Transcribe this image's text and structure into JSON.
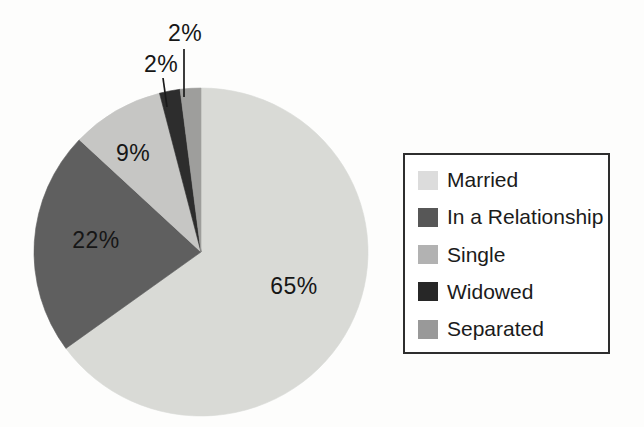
{
  "figure": {
    "background": "#fdfdfc"
  },
  "chart_data": {
    "type": "pie",
    "title": "",
    "legend_position": "right",
    "legend_border_color": "#2e2e2e",
    "legend_background": "#ffffff",
    "label_color": "#161616",
    "leader_line_color": "#1a1a1a",
    "categories": [
      "Married",
      "In a Relationship",
      "Single",
      "Widowed",
      "Separated"
    ],
    "values": [
      65,
      22,
      9,
      2,
      2
    ],
    "slices": [
      {
        "label": "Married",
        "value": 65,
        "pct_label": "65%",
        "slice_color": "#d9dad6",
        "swatch_color": "#dcdcdc",
        "label_x": 294,
        "label_y": 294,
        "leader": null
      },
      {
        "label": "In a Relationship",
        "value": 22,
        "pct_label": "22%",
        "slice_color": "#5f5f5f",
        "swatch_color": "#575757",
        "label_x": 96,
        "label_y": 248,
        "leader": null
      },
      {
        "label": "Single",
        "value": 9,
        "pct_label": "9%",
        "slice_color": "#c6c6c4",
        "swatch_color": "#b2b2b2",
        "label_x": 133,
        "label_y": 161,
        "leader": null
      },
      {
        "label": "Widowed",
        "value": 2,
        "pct_label": "2%",
        "slice_color": "#2d2d2d",
        "swatch_color": "#272727",
        "label_x": 161,
        "label_y": 72,
        "leader": {
          "x1": 163,
          "y1": 78,
          "x2": 167,
          "y2": 107
        }
      },
      {
        "label": "Separated",
        "value": 2,
        "pct_label": "2%",
        "slice_color": "#9e9e9c",
        "swatch_color": "#999999",
        "label_x": 185,
        "label_y": 41,
        "leader": {
          "x1": 184,
          "y1": 49,
          "x2": 184,
          "y2": 97
        }
      }
    ],
    "geometry": {
      "cx": 201,
      "cy": 252,
      "rx": 167,
      "ry": 164,
      "start_angle_deg": 0,
      "direction": "clockwise"
    }
  }
}
